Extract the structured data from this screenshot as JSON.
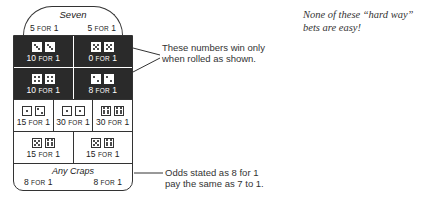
{
  "board": {
    "seven": {
      "title": "Seven",
      "pay_left": "5",
      "pay_right": "5"
    },
    "for_label": "FOR",
    "one": "1",
    "hard_way": [
      [
        {
          "dice": [
            3,
            3
          ],
          "pay": "10"
        },
        {
          "dice": [
            5,
            5
          ],
          "pay": "0"
        }
      ],
      [
        {
          "dice": [
            4,
            4
          ],
          "pay": "10"
        },
        {
          "dice": [
            2,
            2
          ],
          "pay": "8"
        }
      ]
    ],
    "proposition": [
      [
        {
          "dice": [
            1,
            2
          ],
          "pay": "15"
        },
        {
          "dice": [
            1,
            1
          ],
          "pay": "30"
        },
        {
          "dice": [
            6,
            6
          ],
          "pay": "30"
        }
      ],
      [
        {
          "dice": [
            5,
            6
          ],
          "pay": "15"
        },
        {
          "dice": [
            5,
            6
          ],
          "pay": "15"
        }
      ]
    ],
    "any_craps": {
      "title": "Any Craps",
      "pay_left": "8",
      "pay_right": "8"
    }
  },
  "annotations": {
    "hard_way_note_line1": "These numbers win only",
    "hard_way_note_line2": "when rolled as shown.",
    "odds_note_line1": "Odds stated as 8 for 1",
    "odds_note_line2": "pay the same as 7 to 1.",
    "sidebar_line1": "None of these “hard way”",
    "sidebar_line2": "bets are easy!"
  }
}
